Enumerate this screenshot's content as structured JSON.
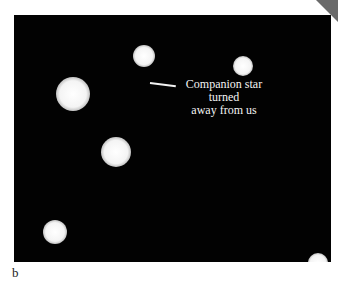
{
  "figure": {
    "panel_label": "b",
    "annotation": {
      "lines": [
        "Companion star",
        "turned",
        "away from us"
      ]
    },
    "stars": [
      {
        "cx": 130,
        "cy": 41,
        "r": 11
      },
      {
        "cx": 229,
        "cy": 51,
        "r": 10
      },
      {
        "cx": 59,
        "cy": 79,
        "r": 17
      },
      {
        "cx": 102,
        "cy": 137,
        "r": 15
      },
      {
        "cx": 41,
        "cy": 217,
        "r": 12
      },
      {
        "cx": 304,
        "cy": 248,
        "r": 10
      }
    ],
    "colors": {
      "background": "#020202",
      "star": "#ffffff",
      "page": "#ffffff"
    }
  }
}
